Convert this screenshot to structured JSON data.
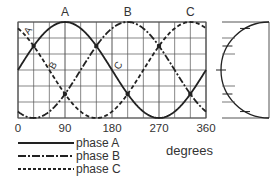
{
  "diagram": {
    "type": "three-phase-waveform",
    "curve_labels": [
      "A",
      "B",
      "C"
    ],
    "inline_labels": [
      "A",
      "B",
      "C"
    ],
    "x_ticks": [
      "0",
      "90",
      "180",
      "270",
      "360"
    ],
    "x_title": "degrees",
    "legend": [
      {
        "label": "phase A",
        "style": "solid"
      },
      {
        "label": "phase B",
        "style": "dash-dot"
      },
      {
        "label": "phase C",
        "style": "dashed"
      }
    ]
  },
  "chart_data": {
    "type": "line",
    "title": "",
    "xlabel": "degrees",
    "ylabel": "",
    "xlim": [
      0,
      360
    ],
    "ylim": [
      -1,
      1
    ],
    "grid": true,
    "x_ticks": [
      0,
      90,
      180,
      270,
      360
    ],
    "series": [
      {
        "name": "phase A",
        "style": "solid",
        "function": "sin(x)",
        "phase_deg": 0
      },
      {
        "name": "phase B",
        "style": "dash-dot",
        "function": "sin(x-120)",
        "phase_deg": 120
      },
      {
        "name": "phase C",
        "style": "dashed",
        "function": "sin(x-240)",
        "phase_deg": 240
      }
    ],
    "legend_position": "bottom-left",
    "side_panel": "semicircle phasor projection with tick marks"
  },
  "colors": {
    "line": "#222222",
    "grid": "#555555",
    "text": "#333333"
  }
}
